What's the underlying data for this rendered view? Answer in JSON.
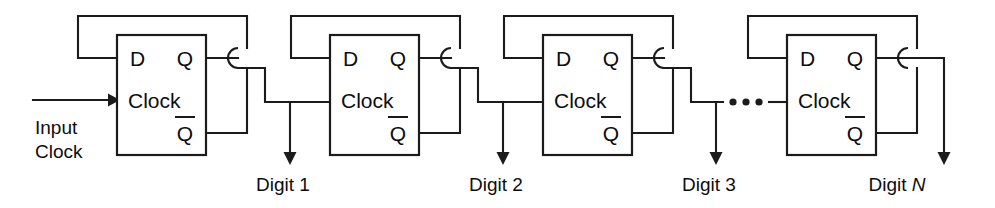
{
  "diagram": {
    "type": "schematic",
    "width": 995,
    "height": 208,
    "line_color": "#1b1b1b",
    "text_color": "#0d0d0d",
    "background_color": "#ffffff"
  },
  "input": {
    "label_line1": "Input",
    "label_line2": "Clock"
  },
  "pins": {
    "d": "D",
    "q": "Q",
    "qbar": "Q",
    "clock": "Clock"
  },
  "stages": [
    {
      "index": 1,
      "d_label": "D",
      "q_label": "Q",
      "qbar_label": "Q",
      "clock_label": "Clock",
      "output_label": "Digit 1",
      "output_label_text": "Digit",
      "output_label_suffix": "1",
      "box": {
        "x": 117,
        "y": 35,
        "width": 89,
        "height": 120
      }
    },
    {
      "index": 2,
      "d_label": "D",
      "q_label": "Q",
      "qbar_label": "Q",
      "clock_label": "Clock",
      "output_label": "Digit 2",
      "output_label_text": "Digit",
      "output_label_suffix": "2",
      "box": {
        "x": 330,
        "y": 35,
        "width": 89,
        "height": 120
      }
    },
    {
      "index": 3,
      "d_label": "D",
      "q_label": "Q",
      "qbar_label": "Q",
      "clock_label": "Clock",
      "output_label": "Digit 3",
      "output_label_text": "Digit",
      "output_label_suffix": "3",
      "box": {
        "x": 543,
        "y": 35,
        "width": 89,
        "height": 120
      }
    },
    {
      "index": 4,
      "d_label": "D",
      "q_label": "Q",
      "qbar_label": "Q",
      "clock_label": "Clock",
      "output_label": "Digit N",
      "output_label_text": "Digit",
      "output_label_suffix": "N",
      "box": {
        "x": 787,
        "y": 35,
        "width": 89,
        "height": 120
      }
    }
  ],
  "ellipsis": {
    "glyph": "•••",
    "dot_count": 3,
    "meaning": "additional identical stages"
  },
  "labels": {
    "digit1": "Digit 1",
    "digit2": "Digit 2",
    "digit3": "Digit 3",
    "digitN": "Digit N",
    "digit_word": "Digit",
    "n_symbol": "N"
  }
}
